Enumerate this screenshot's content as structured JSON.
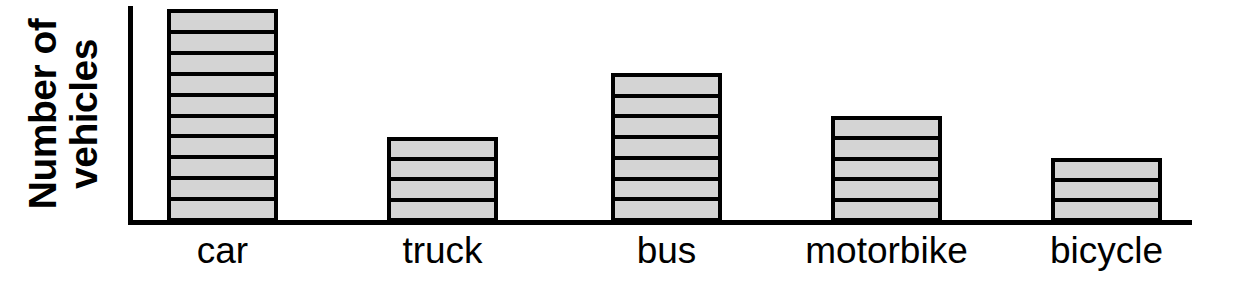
{
  "chart_data": {
    "type": "bar",
    "title": "",
    "xlabel": "",
    "ylabel": "Number of vehicles",
    "ylabel_line1": "Number of",
    "ylabel_line2": "vehicles",
    "categories": [
      "car",
      "truck",
      "bus",
      "motorbike",
      "bicycle"
    ],
    "values": [
      10,
      4,
      7,
      5,
      3
    ],
    "unit_label": "segments",
    "ylim": [
      0,
      10
    ],
    "grid": false,
    "legend": "none",
    "axis_ticks_shown": false,
    "bar_style": {
      "fill_color": "#d4d4d4",
      "outline_color": "#000000",
      "segment_divider_color": "#000000",
      "segmented": true,
      "segment_value": 1
    },
    "axis_color": "#000000",
    "background_color": "#ffffff",
    "bars": [
      {
        "category": "car",
        "value": 10,
        "segments": 10
      },
      {
        "category": "truck",
        "value": 4,
        "segments": 4
      },
      {
        "category": "bus",
        "value": 7,
        "segments": 7
      },
      {
        "category": "motorbike",
        "value": 5,
        "segments": 5
      },
      {
        "category": "bicycle",
        "value": 3,
        "segments": 3
      }
    ]
  }
}
